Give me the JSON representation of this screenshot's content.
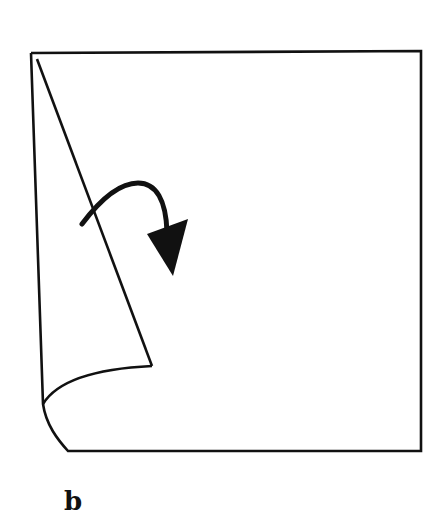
{
  "figure": {
    "panel_label": "b",
    "stroke_color": "#111111",
    "background": "#ffffff",
    "elements": {
      "sheet_outline": "square-sheet",
      "crease_line": "diagonal-fold-line",
      "curled_corner": "curled-flap",
      "arrow": "fold-direction-arrow"
    }
  }
}
